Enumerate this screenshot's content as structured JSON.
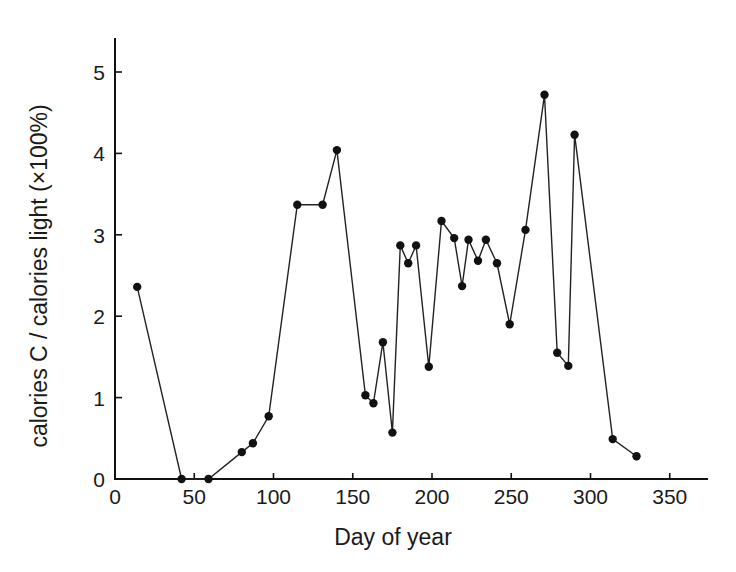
{
  "chart_data": {
    "type": "line",
    "title": "",
    "xlabel": "Day of year",
    "ylabel": "calories C / calories light  (×100%)",
    "xlim": [
      0,
      375
    ],
    "ylim": [
      0,
      5.4
    ],
    "xticks": [
      0,
      50,
      100,
      150,
      200,
      250,
      300,
      350
    ],
    "yticks": [
      0,
      1,
      2,
      3,
      4,
      5
    ],
    "grid": false,
    "legend": null,
    "markers": "filled-circle",
    "series": [
      {
        "name": "calories C / calories light",
        "x": [
          14,
          42,
          59,
          80,
          87,
          97,
          115,
          131,
          140,
          158,
          163,
          169,
          175,
          180,
          185,
          190,
          198,
          206,
          214,
          219,
          223,
          229,
          234,
          241,
          249,
          259,
          271,
          279,
          286,
          290,
          314,
          329
        ],
        "y": [
          2.36,
          0.0,
          0.0,
          0.33,
          0.44,
          0.77,
          3.37,
          3.37,
          4.04,
          1.03,
          0.93,
          1.68,
          0.57,
          2.87,
          2.65,
          2.87,
          1.38,
          3.17,
          2.96,
          2.37,
          2.94,
          2.68,
          2.94,
          2.65,
          1.9,
          3.06,
          4.72,
          1.55,
          1.39,
          4.23,
          0.49,
          0.28
        ]
      }
    ]
  },
  "layout": {
    "plot_left_px": 115,
    "plot_bottom_px": 479,
    "x_px_per_unit": 1.585,
    "y_px_per_unit": 81.4,
    "x_axis_end_px": 708,
    "y_axis_top_px": 38,
    "marker_radius": 4.2
  }
}
